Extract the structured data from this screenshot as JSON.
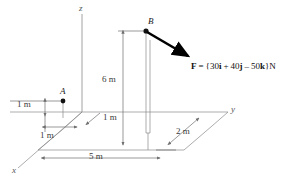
{
  "figure": {
    "type": "statics-3d-force-diagram",
    "axes": {
      "x_label": "x",
      "y_label": "y",
      "z_label": "z"
    },
    "points": [
      {
        "id": "A",
        "label": "A"
      },
      {
        "id": "B",
        "label": "B"
      }
    ],
    "dimensions": [
      {
        "id": "a-height",
        "label": "1 m"
      },
      {
        "id": "a-offset-x",
        "label": "1 m"
      },
      {
        "id": "a-offset-y",
        "label": "1 m"
      },
      {
        "id": "b-height",
        "label": "6 m"
      },
      {
        "id": "base-length",
        "label": "5 m"
      },
      {
        "id": "base-depth",
        "label": "2 m"
      }
    ],
    "force": {
      "symbol": "F",
      "equals": "=",
      "open_brace": "{",
      "i_value": "30",
      "i_unit": "i",
      "plus": "+",
      "j_value": "40",
      "j_unit": "j",
      "minus": "–",
      "k_value": "50",
      "k_unit": "k",
      "close_brace": "}",
      "units": "N",
      "full_text": "F = {30i + 40j – 50k}N"
    },
    "colors": {
      "line": "#7d7d7d",
      "arrow": "#000000",
      "text": "#1a1a1a",
      "background": "#ffffff"
    }
  }
}
